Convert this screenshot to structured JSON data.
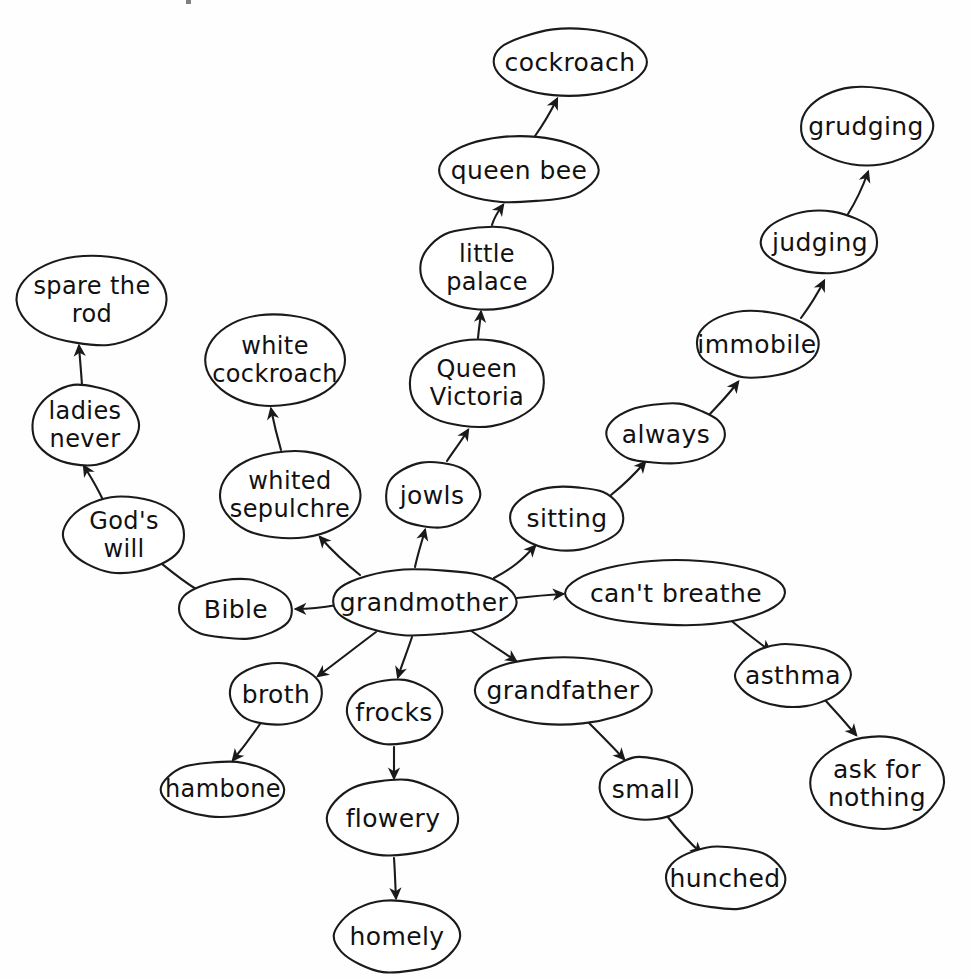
{
  "page": {
    "background_color": "#fefefe",
    "ink_color": "#1a1a1a",
    "width": 970,
    "height": 979,
    "style": "hand-drawn concept map, ellipse nodes with directed arrows"
  },
  "chart_data": {
    "type": "diagram",
    "root": "grandmother",
    "nodes": [
      {
        "id": "grandmother",
        "label": "grandmother",
        "cx": 424,
        "cy": 602,
        "rx": 92,
        "ry": 33,
        "font_size": 25
      },
      {
        "id": "bible",
        "label": "Bible",
        "cx": 236,
        "cy": 609,
        "rx": 57,
        "ry": 30,
        "font_size": 25
      },
      {
        "id": "gods_will",
        "label": "God's\nwill",
        "cx": 124,
        "cy": 535,
        "rx": 60,
        "ry": 38,
        "font_size": 24
      },
      {
        "id": "ladies_never",
        "label": "ladies\nnever",
        "cx": 85,
        "cy": 425,
        "rx": 53,
        "ry": 40,
        "font_size": 24
      },
      {
        "id": "spare_the_rod",
        "label": "spare  the\nrod",
        "cx": 92,
        "cy": 300,
        "rx": 75,
        "ry": 45,
        "font_size": 24
      },
      {
        "id": "whited_sepulchre",
        "label": "whited\nsepulchre",
        "cx": 290,
        "cy": 495,
        "rx": 70,
        "ry": 44,
        "font_size": 24
      },
      {
        "id": "white_cockroach",
        "label": "white\ncockroach",
        "cx": 275,
        "cy": 360,
        "rx": 70,
        "ry": 46,
        "font_size": 24
      },
      {
        "id": "broth",
        "label": "broth",
        "cx": 276,
        "cy": 694,
        "rx": 46,
        "ry": 31,
        "font_size": 25
      },
      {
        "id": "hambone",
        "label": "hambone",
        "cx": 223,
        "cy": 789,
        "rx": 61,
        "ry": 28,
        "font_size": 24
      },
      {
        "id": "frocks",
        "label": "frocks",
        "cx": 394,
        "cy": 712,
        "rx": 47,
        "ry": 33,
        "font_size": 25
      },
      {
        "id": "flowery",
        "label": "flowery",
        "cx": 393,
        "cy": 818,
        "rx": 65,
        "ry": 38,
        "font_size": 25
      },
      {
        "id": "homely",
        "label": "homely",
        "cx": 397,
        "cy": 936,
        "rx": 62,
        "ry": 36,
        "font_size": 25
      },
      {
        "id": "jowls",
        "label": "jowls",
        "cx": 432,
        "cy": 495,
        "rx": 47,
        "ry": 33,
        "font_size": 25
      },
      {
        "id": "queen_victoria",
        "label": "Queen\nVictoria",
        "cx": 477,
        "cy": 383,
        "rx": 68,
        "ry": 44,
        "font_size": 24
      },
      {
        "id": "little_palace",
        "label": "little\npalace",
        "cx": 487,
        "cy": 268,
        "rx": 67,
        "ry": 42,
        "font_size": 24
      },
      {
        "id": "queen_bee",
        "label": "queen bee",
        "cx": 519,
        "cy": 170,
        "rx": 80,
        "ry": 33,
        "font_size": 25
      },
      {
        "id": "cockroach",
        "label": "cockroach",
        "cx": 570,
        "cy": 62,
        "rx": 77,
        "ry": 33,
        "font_size": 25
      },
      {
        "id": "sitting",
        "label": "sitting",
        "cx": 567,
        "cy": 518,
        "rx": 57,
        "ry": 32,
        "font_size": 25
      },
      {
        "id": "always",
        "label": "always",
        "cx": 666,
        "cy": 434,
        "rx": 59,
        "ry": 30,
        "font_size": 25
      },
      {
        "id": "immobile",
        "label": "immobile",
        "cx": 757,
        "cy": 344,
        "rx": 61,
        "ry": 33,
        "font_size": 25
      },
      {
        "id": "judging",
        "label": "judging",
        "cx": 820,
        "cy": 242,
        "rx": 58,
        "ry": 31,
        "font_size": 25
      },
      {
        "id": "grudging",
        "label": "grudging",
        "cx": 866,
        "cy": 126,
        "rx": 66,
        "ry": 39,
        "font_size": 25
      },
      {
        "id": "cant_breathe",
        "label": "can't breathe",
        "cx": 676,
        "cy": 593,
        "rx": 110,
        "ry": 32,
        "font_size": 25
      },
      {
        "id": "asthma",
        "label": "asthma",
        "cx": 793,
        "cy": 675,
        "rx": 57,
        "ry": 31,
        "font_size": 25
      },
      {
        "id": "ask_for_nothing",
        "label": "ask for\nnothing",
        "cx": 877,
        "cy": 783,
        "rx": 66,
        "ry": 46,
        "font_size": 25
      },
      {
        "id": "grandfather",
        "label": "grandfather",
        "cx": 563,
        "cy": 690,
        "rx": 88,
        "ry": 34,
        "font_size": 25
      },
      {
        "id": "small",
        "label": "small",
        "cx": 646,
        "cy": 789,
        "rx": 46,
        "ry": 32,
        "font_size": 25
      },
      {
        "id": "hunched",
        "label": "hunched",
        "cx": 725,
        "cy": 878,
        "rx": 60,
        "ry": 31,
        "font_size": 25
      }
    ],
    "edges": [
      {
        "from": "grandmother",
        "to": "bible",
        "d": "M 337 605 C 320 608 308 609 296 609"
      },
      {
        "from": "bible",
        "to": "gods_will",
        "d": "M 196 589 C 178 578 165 566 152 556"
      },
      {
        "from": "gods_will",
        "to": "ladies_never",
        "d": "M 103 500 C 96 485 90 476 84 466"
      },
      {
        "from": "ladies_never",
        "to": "spare_the_rod",
        "d": "M 82 385 C 81 370 80 360 79 346"
      },
      {
        "from": "grandmother",
        "to": "whited_sepulchre",
        "d": "M 360 575 C 345 563 334 553 320 537"
      },
      {
        "from": "whited_sepulchre",
        "to": "white_cockroach",
        "d": "M 281 450 C 277 436 274 424 271 409"
      },
      {
        "from": "grandmother",
        "to": "jowls",
        "d": "M 415 567 C 418 553 421 545 425 530"
      },
      {
        "from": "jowls",
        "to": "queen_victoria",
        "d": "M 447 461 C 455 449 460 443 468 430"
      },
      {
        "from": "queen_victoria",
        "to": "little_palace",
        "d": "M 478 338 C 479 327 480 323 481 312"
      },
      {
        "from": "little_palace",
        "to": "queen_bee",
        "d": "M 492 225 C 495 215 498 212 503 205"
      },
      {
        "from": "queen_bee",
        "to": "cockroach",
        "d": "M 535 136 C 545 122 550 113 557 99"
      },
      {
        "from": "grandmother",
        "to": "sitting",
        "d": "M 494 578 C 513 568 522 560 535 546"
      },
      {
        "from": "sitting",
        "to": "always",
        "d": "M 611 495 C 626 483 634 475 645 462"
      },
      {
        "from": "always",
        "to": "immobile",
        "d": "M 710 414 C 723 400 729 394 738 382"
      },
      {
        "from": "immobile",
        "to": "judging",
        "d": "M 801 318 C 812 303 817 295 824 281"
      },
      {
        "from": "judging",
        "to": "grudging",
        "d": "M 848 214 C 858 198 862 189 868 172"
      },
      {
        "from": "grandmother",
        "to": "cant_breathe",
        "d": "M 517 598 C 535 596 546 595 563 594"
      },
      {
        "from": "cant_breathe",
        "to": "asthma",
        "d": "M 728 618 C 746 633 757 641 770 651"
      },
      {
        "from": "asthma",
        "to": "ask_for_nothing",
        "d": "M 825 700 C 838 714 845 722 856 735"
      },
      {
        "from": "grandmother",
        "to": "grandfather",
        "d": "M 470 630 C 490 644 500 650 516 661"
      },
      {
        "from": "grandfather",
        "to": "small",
        "d": "M 588 722 C 604 738 612 746 624 759"
      },
      {
        "from": "small",
        "to": "hunched",
        "d": "M 667 816 C 682 835 690 843 701 853"
      },
      {
        "from": "grandmother",
        "to": "broth",
        "d": "M 376 632 C 352 650 337 662 318 676"
      },
      {
        "from": "broth",
        "to": "hambone",
        "d": "M 260 724 C 249 740 242 749 233 760"
      },
      {
        "from": "grandmother",
        "to": "frocks",
        "d": "M 412 637 C 406 655 402 664 398 677"
      },
      {
        "from": "frocks",
        "to": "flowery",
        "d": "M 394 747 C 394 760 394 766 394 778"
      },
      {
        "from": "flowery",
        "to": "homely",
        "d": "M 394 858 C 395 872 395 880 396 898"
      }
    ],
    "arrowhead": {
      "size": 11,
      "color": "#1a1a1a"
    },
    "edge_count": 27,
    "node_count": 28
  }
}
